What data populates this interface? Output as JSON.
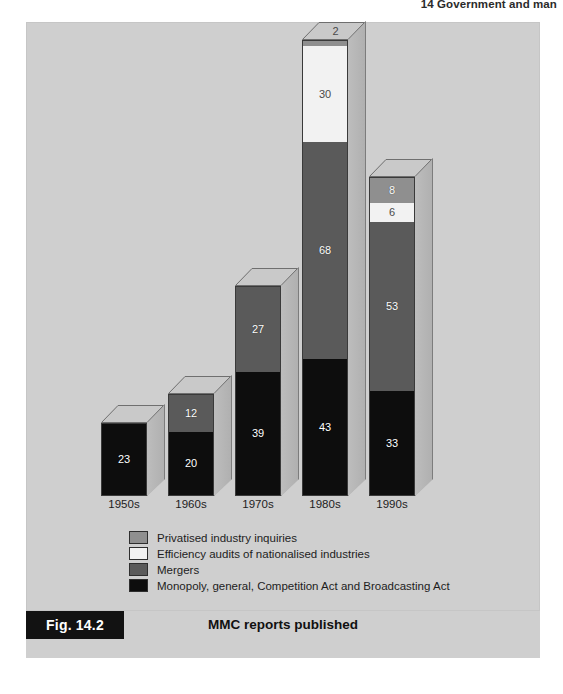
{
  "page": {
    "running_header": "14  Government and man",
    "body_text_fragment": "Fig. 14.2"
  },
  "figure": {
    "badge": "Fig. 14.2",
    "title": "MMC reports published",
    "source": "Source: Monopolies and Mergers Commission."
  },
  "colors": {
    "panel_background": "#cfcfcf",
    "privatised": "#8f8f8f",
    "efficiency": "#f2f2f2",
    "mergers": "#5a5a5a",
    "monopoly": "#0d0d0d",
    "side_face": "#b6b6b6",
    "top_cap": "#c9c9c9",
    "badge_background": "#121212"
  },
  "legend": {
    "items": [
      {
        "label": "Privatised industry inquiries",
        "color": "#8f8f8f",
        "key": "privatised"
      },
      {
        "label": "Efficiency audits of nationalised industries",
        "color": "#f2f2f2",
        "key": "efficiency"
      },
      {
        "label": "Mergers",
        "color": "#5a5a5a",
        "key": "mergers"
      },
      {
        "label": "Monopoly, general, Competition Act and Broadcasting Act",
        "color": "#0d0d0d",
        "key": "monopoly"
      }
    ]
  },
  "axis": {
    "tick_labels": [
      "1950s",
      "1960s",
      "1970s",
      "1980s",
      "1990s"
    ]
  },
  "chart_data": {
    "type": "bar",
    "subtype": "stacked-3d-column",
    "title": "MMC reports published",
    "xlabel": "",
    "ylabel": "",
    "grid": false,
    "legend_position": "below-plot-left",
    "ylim": [
      0,
      143
    ],
    "categories": [
      "1950s",
      "1960s",
      "1970s",
      "1980s",
      "1990s"
    ],
    "series": [
      {
        "name": "Monopoly, general, Competition Act and Broadcasting Act",
        "color": "#0d0d0d",
        "values": [
          23,
          20,
          39,
          43,
          33
        ]
      },
      {
        "name": "Mergers",
        "color": "#5a5a5a",
        "values": [
          0,
          12,
          27,
          68,
          53
        ]
      },
      {
        "name": "Efficiency audits of nationalised industries",
        "color": "#f2f2f2",
        "values": [
          0,
          0,
          0,
          30,
          6
        ]
      },
      {
        "name": "Privatised industry inquiries",
        "color": "#8f8f8f",
        "values": [
          0,
          0,
          0,
          2,
          8
        ]
      }
    ],
    "totals": [
      23,
      32,
      66,
      143,
      100
    ],
    "annotations": [
      {
        "category": "1950s",
        "series": "Monopoly, general, Competition Act and Broadcasting Act",
        "text": "23"
      },
      {
        "category": "1960s",
        "series": "Monopoly, general, Competition Act and Broadcasting Act",
        "text": "20"
      },
      {
        "category": "1960s",
        "series": "Mergers",
        "text": "12"
      },
      {
        "category": "1970s",
        "series": "Monopoly, general, Competition Act and Broadcasting Act",
        "text": "39"
      },
      {
        "category": "1970s",
        "series": "Mergers",
        "text": "27"
      },
      {
        "category": "1980s",
        "series": "Monopoly, general, Competition Act and Broadcasting Act",
        "text": "43"
      },
      {
        "category": "1980s",
        "series": "Mergers",
        "text": "68"
      },
      {
        "category": "1980s",
        "series": "Efficiency audits of nationalised industries",
        "text": "30"
      },
      {
        "category": "1980s",
        "series": "Privatised industry inquiries",
        "text": "2"
      },
      {
        "category": "1990s",
        "series": "Monopoly, general, Competition Act and Broadcasting Act",
        "text": "33"
      },
      {
        "category": "1990s",
        "series": "Mergers",
        "text": "53"
      },
      {
        "category": "1990s",
        "series": "Efficiency audits of nationalised industries",
        "text": "6"
      },
      {
        "category": "1990s",
        "series": "Privatised industry inquiries",
        "text": "8"
      }
    ]
  },
  "bars": [
    {
      "category": "1950s",
      "left": 75,
      "total": 23,
      "top_label": "",
      "segments": [
        {
          "key": "privatised",
          "value": 0,
          "label": "",
          "color": "#8f8f8f",
          "light": false
        },
        {
          "key": "efficiency",
          "value": 0,
          "label": "",
          "color": "#f2f2f2",
          "light": true
        },
        {
          "key": "mergers",
          "value": 0,
          "label": "",
          "color": "#5a5a5a",
          "light": false
        },
        {
          "key": "monopoly",
          "value": 23,
          "label": "23",
          "color": "#0d0d0d",
          "light": false
        }
      ]
    },
    {
      "category": "1960s",
      "left": 142,
      "total": 32,
      "top_label": "",
      "segments": [
        {
          "key": "privatised",
          "value": 0,
          "label": "",
          "color": "#8f8f8f",
          "light": false
        },
        {
          "key": "efficiency",
          "value": 0,
          "label": "",
          "color": "#f2f2f2",
          "light": true
        },
        {
          "key": "mergers",
          "value": 12,
          "label": "12",
          "color": "#5a5a5a",
          "light": false
        },
        {
          "key": "monopoly",
          "value": 20,
          "label": "20",
          "color": "#0d0d0d",
          "light": false
        }
      ]
    },
    {
      "category": "1970s",
      "left": 209,
      "total": 66,
      "top_label": "",
      "segments": [
        {
          "key": "privatised",
          "value": 0,
          "label": "",
          "color": "#8f8f8f",
          "light": false
        },
        {
          "key": "efficiency",
          "value": 0,
          "label": "",
          "color": "#f2f2f2",
          "light": true
        },
        {
          "key": "mergers",
          "value": 27,
          "label": "27",
          "color": "#5a5a5a",
          "light": false
        },
        {
          "key": "monopoly",
          "value": 39,
          "label": "39",
          "color": "#0d0d0d",
          "light": false
        }
      ]
    },
    {
      "category": "1980s",
      "left": 276,
      "total": 143,
      "top_label": "2",
      "segments": [
        {
          "key": "privatised",
          "value": 2,
          "label": "",
          "color": "#8f8f8f",
          "light": false
        },
        {
          "key": "efficiency",
          "value": 30,
          "label": "30",
          "color": "#f2f2f2",
          "light": true
        },
        {
          "key": "mergers",
          "value": 68,
          "label": "68",
          "color": "#5a5a5a",
          "light": false
        },
        {
          "key": "monopoly",
          "value": 43,
          "label": "43",
          "color": "#0d0d0d",
          "light": false
        }
      ]
    },
    {
      "category": "1990s",
      "left": 343,
      "total": 100,
      "top_label": "",
      "segments": [
        {
          "key": "privatised",
          "value": 8,
          "label": "8",
          "color": "#8f8f8f",
          "light": false
        },
        {
          "key": "efficiency",
          "value": 6,
          "label": "6",
          "color": "#f2f2f2",
          "light": true
        },
        {
          "key": "mergers",
          "value": 53,
          "label": "53",
          "color": "#5a5a5a",
          "light": false
        },
        {
          "key": "monopoly",
          "value": 33,
          "label": "33",
          "color": "#0d0d0d",
          "light": false
        }
      ]
    }
  ]
}
